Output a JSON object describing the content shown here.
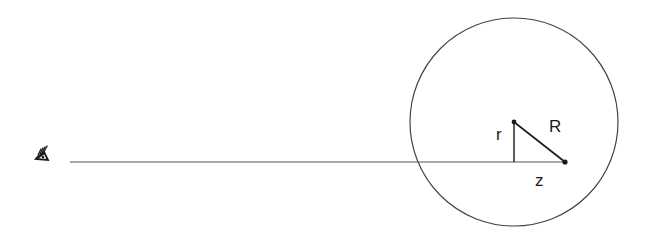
{
  "diagram": {
    "type": "geometry",
    "labels": {
      "r": "r",
      "R": "R",
      "z": "z"
    },
    "observer_icon": "eye-icon",
    "colors": {
      "stroke": "#1a1a1a",
      "circle_stroke": "#444444",
      "background": "#ffffff"
    },
    "geometry": {
      "circle": {
        "cx": 514,
        "cy": 122,
        "r": 104
      },
      "sight_line": {
        "x1": 70,
        "y1": 162,
        "x2": 565,
        "y2": 162
      },
      "triangle": {
        "top_vertex": [
          514,
          122
        ],
        "foot": [
          514,
          162
        ],
        "right_vertex": [
          565,
          162
        ]
      }
    }
  }
}
